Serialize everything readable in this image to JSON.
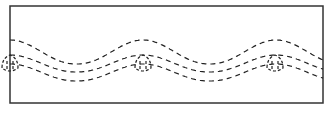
{
  "diagram": {
    "type": "wave-streamlines",
    "frame": {
      "x": 10,
      "y": 6,
      "width": 313,
      "height": 97,
      "stroke": "#333333"
    },
    "line_color": "#222222",
    "dash": "5,4",
    "peaks_x": [
      10,
      143,
      275
    ],
    "lines": [
      {
        "name": "upper",
        "peak_y": 40,
        "trough_y": 64
      },
      {
        "name": "middle",
        "peak_y": 55,
        "trough_y": 72
      },
      {
        "name": "lower",
        "peak_y": 64,
        "trough_y": 81
      }
    ],
    "vortex": {
      "top_y": 55,
      "bottom_y": 72,
      "half_width": 8
    }
  }
}
